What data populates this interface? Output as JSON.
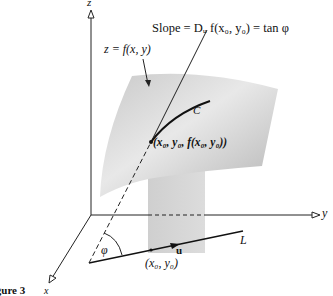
{
  "figure": {
    "caption": "Figure 3",
    "axes": {
      "x_label": "x",
      "y_label": "y",
      "z_label": "z"
    },
    "surface_label": "z = f(x, y)",
    "slope_label": "Slope = Dᵤ f(x₀, y₀) = tan φ",
    "curve_label": "C",
    "point_3d_label": "(x₀, y₀, f(x₀, y₀))",
    "point_2d_label": "(x₀, y₀)",
    "line_label": "L",
    "vector_label": "u",
    "angle_label": "φ",
    "colors": {
      "ink": "#111111",
      "surface_light": "#e6e6e6",
      "surface_dark": "#b8b8b8",
      "strip": "#d4d4d4",
      "background": "#ffffff"
    }
  }
}
